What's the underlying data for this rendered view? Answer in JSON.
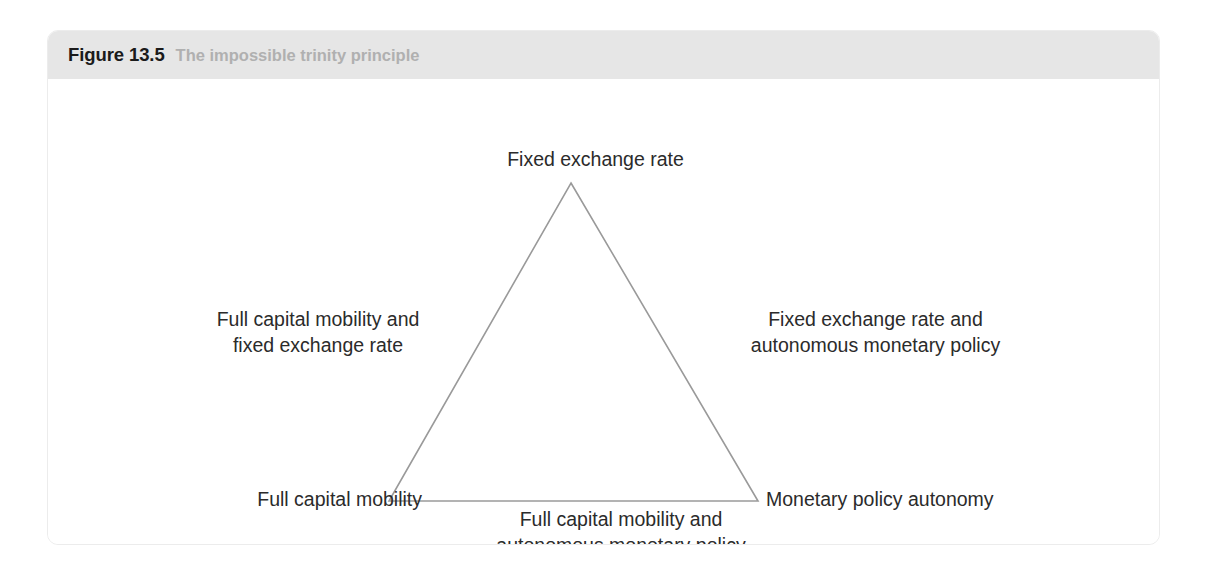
{
  "figure": {
    "number": "Figure 13.5",
    "caption": "The impossible trinity principle"
  },
  "diagram": {
    "type": "triangle",
    "stroke_color": "#9a9a9a",
    "vertex_labels": {
      "apex": "Fixed exchange rate",
      "bottom_left": "Full capital mobility",
      "bottom_right": "Monetary policy autonomy"
    },
    "edge_labels": {
      "left": {
        "line1": "Full capital mobility and",
        "line2": "fixed exchange rate"
      },
      "right": {
        "line1": "Fixed exchange rate and",
        "line2": "autonomous monetary policy"
      },
      "bottom": {
        "line1": "Full capital mobility and",
        "line2": "autonomous monetary policy"
      }
    }
  },
  "colors": {
    "header_band": "#e6e6e6",
    "figure_number_text": "#1b1b1b",
    "caption_text": "#b0b0b0",
    "label_text": "#2b2b2b",
    "card_border": "#ececec"
  }
}
